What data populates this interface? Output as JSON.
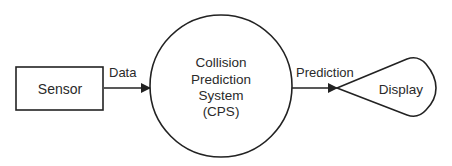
{
  "diagram": {
    "type": "data-flow",
    "nodes": [
      {
        "id": "sensor",
        "label": "Sensor",
        "shape": "rectangle"
      },
      {
        "id": "cps",
        "label_lines": [
          "Collision",
          "Prediction",
          "System",
          "(CPS)"
        ],
        "shape": "circle"
      },
      {
        "id": "display",
        "label": "Display",
        "shape": "teardrop"
      }
    ],
    "edges": [
      {
        "from": "sensor",
        "to": "cps",
        "label": "Data"
      },
      {
        "from": "cps",
        "to": "display",
        "label": "Prediction"
      }
    ]
  }
}
